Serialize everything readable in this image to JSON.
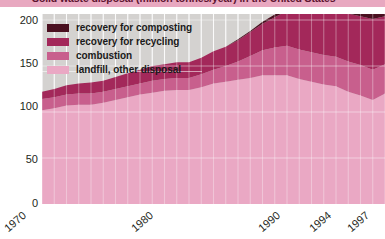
{
  "title": {
    "text": "Solid waste disposal (million tonnes/year) in the United States"
  },
  "legend": {
    "items": [
      {
        "label": "recovery for composting",
        "color": "#4a1020"
      },
      {
        "label": "recovery for recycling",
        "color": "#a3285a"
      },
      {
        "label": "combustion",
        "color": "#c85f8d"
      },
      {
        "label": "landfill, other disposal",
        "color": "#eaa8c4"
      }
    ]
  },
  "axes": {
    "y_ticks": [
      "200",
      "150",
      "100",
      "50",
      "0"
    ],
    "x_ticks": [
      "1970",
      "1980",
      "1990",
      "1994",
      "1997"
    ]
  },
  "colors": {
    "plot_background": "#d4d2d0",
    "gridline": "#ffffff",
    "title_banner": "#e8a8c0",
    "title_text": "#5e1430"
  },
  "chart_data": {
    "type": "area",
    "title": "Solid waste disposal (million tonnes/year) in the United States",
    "xlabel": "",
    "ylabel": "million tonnes/year",
    "xlim": [
      1970,
      1998
    ],
    "ylim": [
      0,
      200
    ],
    "grid": true,
    "stacked": true,
    "legend_position": "top-left inside plot",
    "x": [
      1970,
      1971,
      1972,
      1973,
      1974,
      1975,
      1976,
      1977,
      1978,
      1979,
      1980,
      1981,
      1982,
      1983,
      1984,
      1985,
      1986,
      1987,
      1988,
      1989,
      1990,
      1991,
      1992,
      1993,
      1994,
      1995,
      1996,
      1997,
      1998
    ],
    "series": [
      {
        "name": "landfill, other disposal",
        "color": "#eaa8c4",
        "values": [
          102,
          104,
          107,
          108,
          108,
          110,
          113,
          116,
          119,
          121,
          123,
          124,
          124,
          127,
          131,
          133,
          135,
          137,
          140,
          140,
          140,
          136,
          133,
          130,
          128,
          122,
          118,
          113,
          120
        ]
      },
      {
        "name": "combustion",
        "color": "#c85f8d",
        "values": [
          12,
          12,
          12,
          12,
          12,
          12,
          12,
          12,
          12,
          13,
          13,
          13,
          13,
          14,
          15,
          17,
          20,
          24,
          27,
          30,
          32,
          32,
          32,
          32,
          32,
          33,
          33,
          33,
          32
        ]
      },
      {
        "name": "recovery for recycling",
        "color": "#a3285a",
        "values": [
          8,
          9,
          10,
          11,
          12,
          12,
          13,
          14,
          15,
          16,
          16,
          17,
          17,
          18,
          20,
          21,
          23,
          26,
          29,
          33,
          38,
          41,
          45,
          47,
          50,
          52,
          53,
          55,
          52
        ]
      },
      {
        "name": "recovery for composting",
        "color": "#4a1020",
        "values": [
          0,
          0,
          0,
          0,
          0,
          0,
          0,
          0,
          0,
          0,
          0,
          0,
          0,
          0,
          0,
          0,
          1,
          1,
          2,
          3,
          4,
          6,
          8,
          10,
          11,
          12,
          13,
          13,
          13
        ]
      }
    ],
    "totals": [
      122,
      125,
      129,
      131,
      132,
      134,
      138,
      142,
      146,
      150,
      152,
      154,
      154,
      159,
      166,
      171,
      179,
      188,
      198,
      206,
      214,
      215,
      218,
      219,
      221,
      219,
      217,
      214,
      217
    ]
  }
}
